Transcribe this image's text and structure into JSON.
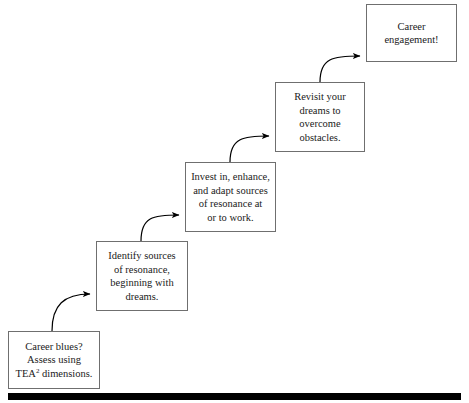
{
  "diagram": {
    "type": "staircase-flowchart",
    "nodes": [
      {
        "id": "career-blues",
        "step": 1,
        "text": "Career blues?\nAssess using\nTEA",
        "superscript": "2",
        "text_tail": " dimensions.",
        "full_text": "Career blues? Assess using TEA2 dimensions.",
        "x": 8,
        "y": 331,
        "w": 92,
        "h": 58
      },
      {
        "id": "identify-sources",
        "step": 2,
        "text": "Identify sources\nof resonance,\nbeginning with\ndreams.",
        "full_text": "Identify sources of resonance, beginning with dreams.",
        "x": 96,
        "y": 241,
        "w": 92,
        "h": 70
      },
      {
        "id": "invest-enhance-adapt",
        "step": 3,
        "text": "Invest in, enhance,\nand adapt sources\nof resonance at\nor to work.",
        "full_text": "Invest in, enhance, and adapt sources of resonance at or to work.",
        "x": 185,
        "y": 162,
        "w": 91,
        "h": 70
      },
      {
        "id": "revisit-dreams",
        "step": 4,
        "text": "Revisit your\ndreams to\novercome\nobstacles.",
        "full_text": "Revisit your dreams to overcome obstacles.",
        "x": 275,
        "y": 82,
        "w": 90,
        "h": 70
      },
      {
        "id": "career-engagement",
        "step": 5,
        "text": "Career\nengagement!",
        "full_text": "Career engagement!",
        "x": 366,
        "y": 4,
        "w": 91,
        "h": 58
      }
    ],
    "connectors": [
      {
        "id": "arrow-1",
        "from": "career-blues",
        "to": "identify-sources"
      },
      {
        "id": "arrow-2",
        "from": "identify-sources",
        "to": "invest-enhance-adapt"
      },
      {
        "id": "arrow-3",
        "from": "invest-enhance-adapt",
        "to": "revisit-dreams"
      },
      {
        "id": "arrow-4",
        "from": "revisit-dreams",
        "to": "career-engagement"
      }
    ],
    "colors": {
      "box_border": "#6f6f6f",
      "text": "#1a1a1a",
      "arrow": "#000000",
      "rule": "#000000",
      "background": "#ffffff"
    }
  }
}
